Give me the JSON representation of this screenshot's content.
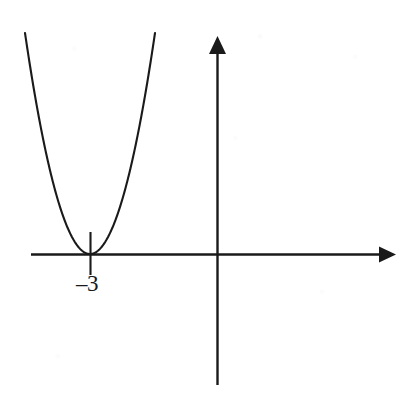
{
  "figure": {
    "width": 413,
    "height": 405,
    "background_color": "#ffffff",
    "ink_color": "#1a1a1a"
  },
  "axes": {
    "x_axis": {
      "name": "x-axis",
      "y_pixel": 254,
      "x_start_pixel": 31,
      "x_end_pixel": 396,
      "has_arrowhead": true,
      "arrow_direction": "right"
    },
    "y_axis": {
      "name": "y-axis",
      "x_pixel": 217,
      "y_start_pixel": 36,
      "y_end_pixel": 385,
      "has_arrowhead": true,
      "arrow_direction": "up"
    },
    "origin": {
      "x_pixel": 217,
      "y_pixel": 254
    }
  },
  "ticks": [
    {
      "name": "tick-minus-three",
      "label": "–3",
      "value": -3,
      "x_pixel": 90,
      "tick_top_pixel": 232,
      "tick_bottom_pixel": 275,
      "label_x_pixel": 91,
      "label_y_pixel": 285
    }
  ],
  "chart_data": {
    "type": "line",
    "xlabel": "",
    "ylabel": "",
    "grid": false,
    "legend": null,
    "axis_arrows": {
      "x": "right",
      "y": "up"
    },
    "xlim": [
      -9.1,
      4.5
    ],
    "ylim": [
      -3.3,
      5.5
    ],
    "tick_labels": {
      "x": [
        "–3"
      ],
      "y": []
    },
    "annotations": [
      {
        "text": "–3",
        "x": -3,
        "y": 0,
        "description": "x-intercept label below the axis at the vertex"
      }
    ],
    "series": [
      {
        "name": "parabola",
        "type": "line",
        "equation": "y = a(x + 3)^2",
        "vertex": [
          -3,
          0
        ],
        "roots": [
          -3
        ],
        "opens": "up",
        "tangent_to_x_axis": true,
        "comment": "Double root at x = -3; curve touches but does not cross the x-axis.",
        "x": [
          -5.3,
          -5.0,
          -4.6,
          -4.2,
          -3.8,
          -3.4,
          -3.0,
          -2.6,
          -2.2,
          -1.8,
          -1.4,
          -1.0,
          -0.75
        ],
        "y": [
          5.3,
          4.0,
          2.56,
          1.44,
          0.64,
          0.16,
          0.0,
          0.16,
          0.64,
          1.44,
          2.56,
          4.0,
          5.06
        ]
      }
    ]
  },
  "curve": {
    "name": "parabola-curve",
    "vertex_pixel": {
      "x": 90,
      "y": 254
    },
    "left_end_pixel": {
      "x": 25,
      "y": 33
    },
    "right_end_pixel": {
      "x": 155,
      "y": 33
    },
    "stroke_width": 2.1
  }
}
